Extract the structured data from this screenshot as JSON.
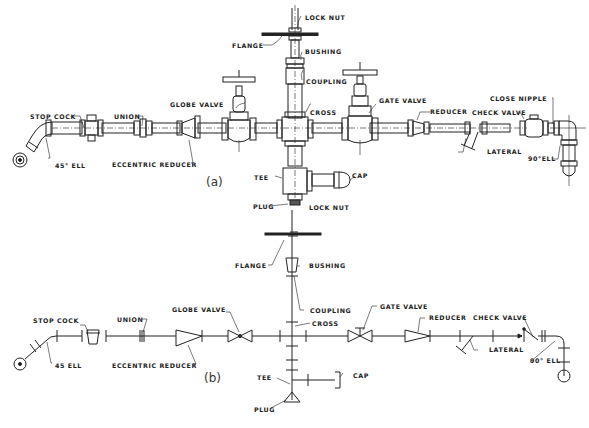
{
  "figure": {
    "part_a": {
      "caption": "(a)",
      "labels": {
        "lock_nut": "LOCK NUT",
        "flange": "FLANGE",
        "bushing": "BUSHING",
        "coupling": "COUPLING",
        "globe_valve": "GLOBE VALVE",
        "gate_valve": "GATE VALVE",
        "cross": "CROSS",
        "union": "UNION",
        "stop_cock": "STOP COCK",
        "reducer": "REDUCER",
        "close_nipple": "CLOSE NIPPLE",
        "check_valve": "CHECK VALVE",
        "lateral": "LATERAL",
        "ell_45": "45° ELL",
        "eccentric_reducer": "ECCENTRIC REDUCER",
        "ell_90": "90°ELL",
        "tee": "TEE",
        "cap": "CAP",
        "plug": "PLUG"
      }
    },
    "part_b": {
      "caption": "(b)",
      "labels": {
        "lock_nut": "LOCK NUT",
        "flange": "FLANGE",
        "bushing": "BUSHING",
        "coupling": "COUPLING",
        "globe_valve": "GLOBE VALVE",
        "gate_valve": "GATE VALVE",
        "cross": "CROSS",
        "stop_cock": "STOP COCK",
        "union": "UNION",
        "reducer": "REDUCER",
        "check_valve": "CHECK VALVE",
        "ell_45": "45 ELL",
        "eccentric_reducer": "ECCENTRIC REDUCER",
        "lateral": "LATERAL",
        "ell_90": "90° ELL",
        "tee": "TEE",
        "cap": "CAP",
        "plug": "PLUG"
      }
    }
  }
}
